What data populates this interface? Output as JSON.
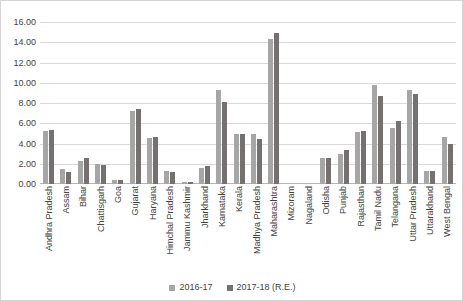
{
  "chart_data": {
    "type": "bar",
    "title": "",
    "subtitle": "",
    "xlabel": "",
    "ylabel": "",
    "ylim": [
      0,
      16
    ],
    "ytick_step": 2,
    "ytick_labels": [
      "0.00",
      "2.00",
      "4.00",
      "6.00",
      "8.00",
      "10.00",
      "12.00",
      "14.00",
      "16.00"
    ],
    "ytick_values": [
      0,
      2,
      4,
      6,
      8,
      10,
      12,
      14,
      16
    ],
    "grid": true,
    "legend_position": "bottom",
    "categories": [
      "Andhra Pradesh",
      "Assam",
      "Bihar",
      "Chattisgarh",
      "Goa",
      "Gujarat",
      "Haryana",
      "Himchal Pradesh",
      "Jammu Kashmir",
      "Jharkhand",
      "Karnataka",
      "Kerala",
      "Madhya Pradesh",
      "Maharashtra",
      "Mizoram",
      "Nagaland",
      "Odisha",
      "Punjab",
      "Rajasthan",
      "Tamil Nadu",
      "Telangana",
      "Uttar Pradesh",
      "Uttarakhand",
      "West Bengal"
    ],
    "series": [
      {
        "name": "2016-17",
        "color": "#a6a6a6",
        "values": [
          5.2,
          1.5,
          2.3,
          2.0,
          0.4,
          7.2,
          4.5,
          1.3,
          0.15,
          1.6,
          9.3,
          4.9,
          4.9,
          14.3,
          0.0,
          0.0,
          2.6,
          3.0,
          5.1,
          9.8,
          5.5,
          9.3,
          1.3,
          4.6
        ]
      },
      {
        "name": "2017-18 (R.E.)",
        "color": "#767171",
        "values": [
          5.3,
          1.2,
          2.6,
          1.9,
          0.4,
          7.4,
          4.6,
          1.2,
          0.15,
          1.8,
          8.1,
          4.9,
          4.4,
          14.9,
          0.0,
          0.0,
          2.6,
          3.4,
          5.2,
          8.7,
          6.2,
          8.9,
          1.3,
          4.0
        ]
      }
    ]
  }
}
